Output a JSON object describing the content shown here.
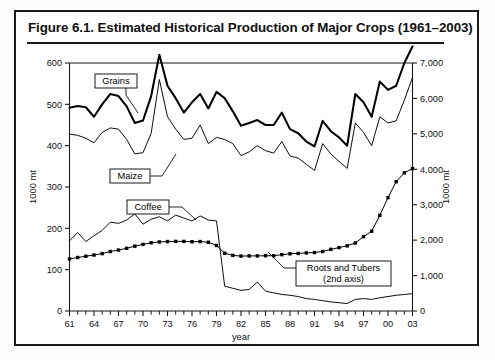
{
  "figure": {
    "title": "Figure 6.1.  Estimated Historical Production of Major Crops (1961–2003)"
  },
  "chart_data": {
    "type": "line",
    "title": "Estimated Historical Production of Major Crops (1961–2003)",
    "xlabel": "year",
    "ylabel": "1000 mt",
    "y2label": "1000 mt",
    "xlim": [
      1961,
      2003
    ],
    "ylim": [
      0,
      600
    ],
    "y2lim": [
      0,
      7000
    ],
    "grid": false,
    "legend": "annotations",
    "x_tick_labels": [
      "61",
      "64",
      "67",
      "70",
      "73",
      "76",
      "79",
      "82",
      "85",
      "88",
      "91",
      "94",
      "97",
      "00",
      "03"
    ],
    "x_tick_years": [
      1961,
      1964,
      1967,
      1970,
      1973,
      1976,
      1979,
      1982,
      1985,
      1988,
      1991,
      1994,
      1997,
      2000,
      2003
    ],
    "y_tick_labels": [
      "0",
      "100",
      "200",
      "300",
      "400",
      "500",
      "600"
    ],
    "y_ticks": [
      0,
      100,
      200,
      300,
      400,
      500,
      600
    ],
    "y2_tick_labels": [
      "0",
      "1,000",
      "2,000",
      "3,000",
      "4,000",
      "5,000",
      "6,000",
      "7,000"
    ],
    "y2_ticks": [
      0,
      1000,
      2000,
      3000,
      4000,
      5000,
      6000,
      7000
    ],
    "x": [
      1961,
      1962,
      1963,
      1964,
      1965,
      1966,
      1967,
      1968,
      1969,
      1970,
      1971,
      1972,
      1973,
      1974,
      1975,
      1976,
      1977,
      1978,
      1979,
      1980,
      1981,
      1982,
      1983,
      1984,
      1985,
      1986,
      1987,
      1988,
      1989,
      1990,
      1991,
      1992,
      1993,
      1994,
      1995,
      1996,
      1997,
      1998,
      1999,
      2000,
      2001,
      2002,
      2003
    ],
    "series": [
      {
        "name": "Grains",
        "axis": "left",
        "style": "thick-line",
        "values": [
          492,
          496,
          493,
          470,
          500,
          525,
          520,
          495,
          455,
          461,
          520,
          620,
          545,
          515,
          480,
          505,
          525,
          490,
          530,
          515,
          483,
          448,
          455,
          462,
          450,
          450,
          480,
          440,
          430,
          410,
          398,
          460,
          435,
          420,
          400,
          525,
          505,
          470,
          555,
          535,
          545,
          600,
          640
        ]
      },
      {
        "name": "Maize",
        "axis": "left",
        "style": "thin-line",
        "values": [
          428,
          425,
          418,
          407,
          432,
          443,
          440,
          415,
          380,
          383,
          430,
          560,
          470,
          440,
          415,
          418,
          450,
          405,
          420,
          415,
          405,
          376,
          385,
          400,
          388,
          382,
          410,
          375,
          370,
          355,
          340,
          405,
          380,
          362,
          345,
          455,
          432,
          400,
          470,
          455,
          460,
          510,
          565
        ]
      },
      {
        "name": "Coffee",
        "axis": "left",
        "style": "thin-line",
        "values": [
          170,
          190,
          168,
          182,
          195,
          215,
          212,
          220,
          235,
          210,
          222,
          228,
          218,
          232,
          225,
          218,
          230,
          220,
          218,
          60,
          55,
          50,
          52,
          70,
          48,
          44,
          40,
          38,
          35,
          30,
          28,
          25,
          22,
          20,
          18,
          28,
          30,
          28,
          32,
          35,
          38,
          40,
          42
        ]
      },
      {
        "name": "Roots and Tubers (2nd axis)",
        "axis": "right",
        "style": "marker-line",
        "values": [
          1470,
          1510,
          1545,
          1580,
          1620,
          1680,
          1720,
          1770,
          1830,
          1880,
          1925,
          1950,
          1960,
          1965,
          1965,
          1955,
          1960,
          1940,
          1850,
          1630,
          1570,
          1550,
          1555,
          1555,
          1560,
          1560,
          1590,
          1615,
          1625,
          1640,
          1650,
          1680,
          1740,
          1790,
          1840,
          1920,
          2100,
          2250,
          2700,
          3200,
          3650,
          3900,
          4020
        ]
      }
    ],
    "annotations": [
      {
        "label": "Grains",
        "lines": [
          "Grains"
        ]
      },
      {
        "label": "Maize",
        "lines": [
          "Maize"
        ]
      },
      {
        "label": "Coffee",
        "lines": [
          "Coffee"
        ]
      },
      {
        "label": "Roots and Tubers",
        "lines": [
          "Roots and Tubers",
          "(2nd axis)"
        ]
      }
    ]
  }
}
